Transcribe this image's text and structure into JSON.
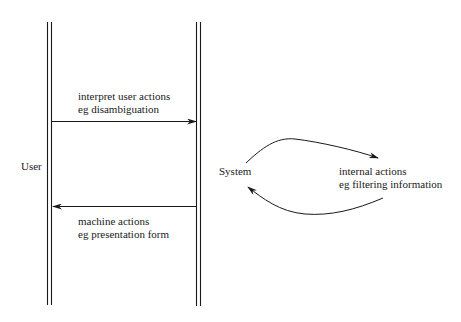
{
  "actors": {
    "user": "User",
    "system": "System"
  },
  "messages": {
    "user_to_system": {
      "line1": "interpret user actions",
      "line2": "eg disambiguation"
    },
    "system_to_user": {
      "line1": "machine actions",
      "line2": "eg presentation form"
    }
  },
  "internal_loop": {
    "line1": "internal actions",
    "line2": "eg filtering information"
  },
  "colors": {
    "ink": "#1a1a1a",
    "background": "#ffffff"
  }
}
